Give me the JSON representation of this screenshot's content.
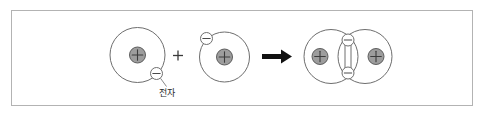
{
  "figure": {
    "domain": "diagram",
    "frame": {
      "border_color": "#b3b3b3",
      "background_color": "#ffffff"
    },
    "colors": {
      "orbit_stroke": "#6e6e6e",
      "nucleus_fill": "#9d9d9d",
      "nucleus_stroke": "#5d5d5d",
      "electron_fill": "#ffffff",
      "electron_stroke": "#6e6e6e",
      "arrow_fill": "#111111",
      "text": "#2a2a2a"
    },
    "symbols": {
      "proton_charge": "+",
      "electron_charge": "-",
      "plus_operator": "+",
      "reaction_arrow": "→"
    },
    "labels": {
      "electron_label": "전자"
    },
    "reactant_left": {
      "name": "hydrogen-atom-left",
      "nucleus_label": "+",
      "electron_count": 1,
      "electron_label": "-",
      "electron_position": "lower-right"
    },
    "operator": {
      "name": "plus-operator",
      "label": "+"
    },
    "reactant_right": {
      "name": "hydrogen-atom-right",
      "nucleus_label": "+",
      "electron_count": 1,
      "electron_label": "-",
      "electron_position": "upper-left"
    },
    "arrow": {
      "name": "reaction-arrow",
      "direction": "right"
    },
    "product": {
      "name": "hydrogen-molecule",
      "nucleus_left_label": "+",
      "nucleus_right_label": "+",
      "shared_electrons": 2,
      "shared_electron_top_label": "-",
      "shared_electron_bottom_label": "-"
    }
  }
}
